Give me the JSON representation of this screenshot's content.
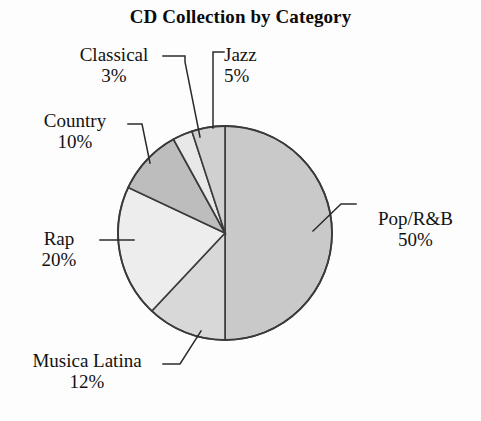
{
  "chart_data": {
    "type": "pie",
    "title": "CD Collection by Category",
    "xlabel": "",
    "ylabel": "",
    "legend_position": "none",
    "grid": false,
    "value_unit": "percent",
    "categories": [
      "Pop/R&B",
      "Musica Latina",
      "Rap",
      "Country",
      "Classical",
      "Jazz"
    ],
    "values": [
      50,
      12,
      20,
      10,
      3,
      5
    ],
    "slices": [
      {
        "label": "Pop/R&B",
        "value": 50,
        "value_text": "50%",
        "color": "#c9c9c9",
        "start_angle_deg": 0,
        "end_angle_deg": 180
      },
      {
        "label": "Musica Latina",
        "value": 12,
        "value_text": "12%",
        "color": "#d8d8d8",
        "start_angle_deg": 180,
        "end_angle_deg": 223.2
      },
      {
        "label": "Rap",
        "value": 20,
        "value_text": "20%",
        "color": "#ededed",
        "start_angle_deg": 223.2,
        "end_angle_deg": 295.2
      },
      {
        "label": "Country",
        "value": 10,
        "value_text": "10%",
        "color": "#bdbdbd",
        "start_angle_deg": 295.2,
        "end_angle_deg": 331.2
      },
      {
        "label": "Classical",
        "value": 3,
        "value_text": "3%",
        "color": "#e8e8e8",
        "start_angle_deg": 331.2,
        "end_angle_deg": 342.0
      },
      {
        "label": "Jazz",
        "value": 5,
        "value_text": "5%",
        "color": "#d0d0d0",
        "start_angle_deg": 342.0,
        "end_angle_deg": 360
      }
    ]
  },
  "title": "CD Collection by Category",
  "callouts": {
    "classical": {
      "category": "Classical",
      "percent": "3%"
    },
    "jazz": {
      "category": "Jazz",
      "percent": "5%"
    },
    "country": {
      "category": "Country",
      "percent": "10%"
    },
    "rap": {
      "category": "Rap",
      "percent": "20%"
    },
    "musica_latina": {
      "category": "Musica Latina",
      "percent": "12%"
    },
    "pop_rb": {
      "category": "Pop/R&B",
      "percent": "50%"
    }
  },
  "style": {
    "outline_color": "#3a3a3a",
    "leader_color": "#2b2b2b",
    "text_color": "#121212",
    "background": "#fdfdfd"
  }
}
